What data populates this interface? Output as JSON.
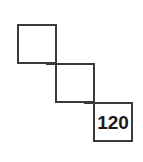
{
  "figure": {
    "background_color": "#ffffff",
    "stroke_color": "#3a3a3a",
    "text_color": "#1a1a1a",
    "stroke_width_px": 2
  },
  "squares": [
    {
      "name": "square-top-left",
      "label": "",
      "x": 17,
      "y": 24,
      "size": 40
    },
    {
      "name": "square-middle",
      "label": "",
      "x": 55,
      "y": 63,
      "size": 40
    },
    {
      "name": "square-bottom-right",
      "label": "120",
      "x": 93,
      "y": 102,
      "size": 40,
      "font_size_px": 19
    }
  ],
  "junction_marks": [
    {
      "name": "junction-mark-upper",
      "x": 55,
      "y": 63
    },
    {
      "name": "junction-mark-lower",
      "x": 93,
      "y": 102
    }
  ]
}
